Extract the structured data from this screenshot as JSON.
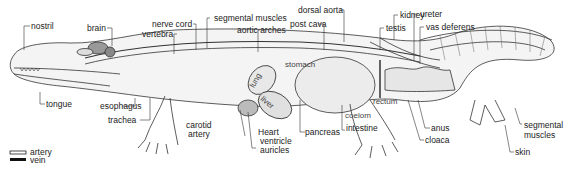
{
  "diagram": {
    "labels": {
      "nostril": "nostril",
      "brain": "brain",
      "nerve_cord": "nerve cord",
      "vertebra": "vertebra",
      "segmental_muscles_top": "segmental muscles",
      "aortic_arches": "aortic arches",
      "post_cava": "post cava",
      "dorsal_aorta": "dorsal aorta",
      "kidney": "kidney",
      "testis": "testis",
      "ureter": "ureter",
      "vas_deferens": "vas deferens",
      "stomach": "stomach",
      "lung": "lung",
      "liver": "liver",
      "rectum": "rectum",
      "coelom": "coelom",
      "tongue": "tongue",
      "esophagus": "esophagus",
      "trachea": "trachea",
      "carotid_artery_line1": "carotid",
      "carotid_artery_line2": "artery",
      "heart": "Heart",
      "ventricle": "ventricle",
      "auricles": "auricles",
      "pancreas": "pancreas",
      "intestine": "intestine",
      "anus": "anus",
      "cloaca": "cloaca",
      "segmental_muscles_tail_line1": "segmental",
      "segmental_muscles_tail_line2": "muscles",
      "skin": "skin"
    },
    "legend": [
      {
        "label": "artery",
        "style": "double-line"
      },
      {
        "label": "vein",
        "style": "solid-black"
      }
    ]
  }
}
